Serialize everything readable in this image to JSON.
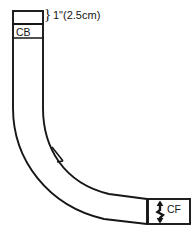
{
  "figure": {
    "type": "sewing-pattern-piece",
    "stroke_color": "#161616",
    "fill_color": "#ffffff",
    "background_color": "#ffffff"
  },
  "dimension": {
    "brace": "}",
    "label": "1\"(2.5cm)"
  },
  "markers": {
    "center_back": {
      "label": "CB"
    },
    "center_front": {
      "label": "CF",
      "arrow_icon": "double-headed-vertical-arrow"
    },
    "notch": {
      "label": ""
    }
  }
}
